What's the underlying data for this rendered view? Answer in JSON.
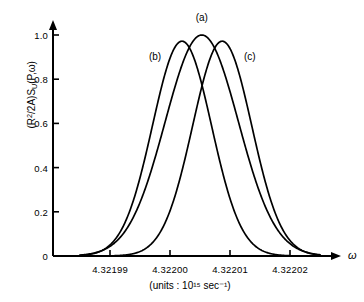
{
  "chart_data": {
    "type": "line",
    "title": "",
    "subtitle": "",
    "xlabel": "ω",
    "xunits": "(units : 10¹⁵ sec⁻¹)",
    "ylabel": "(R²/2A)Sᵤ(P,ω)",
    "xlim": [
      4.321985,
      4.322025
    ],
    "ylim": [
      0,
      1.06
    ],
    "grid": false,
    "legend_position": "inline-annotations",
    "x_tick_labels": [
      "4.32199",
      "4.32200",
      "4.32201",
      "4.32202"
    ],
    "x_tick_values": [
      4.32199,
      4.322,
      4.32201,
      4.32202
    ],
    "y_tick_labels": [
      "0",
      "0.2",
      "0.4",
      "0.6",
      "0.8",
      "1.0"
    ],
    "y_tick_values": [
      0,
      0.2,
      0.4,
      0.6,
      0.8,
      1.0
    ],
    "axis_style": "arrow-tipped",
    "line_color": "#000000",
    "background_color": "#ffffff",
    "series": [
      {
        "name": "(a)",
        "label": "(a)",
        "peak_x": 4.3220053,
        "peak_y": 1.0,
        "half_width": 7.2e-06,
        "annotation_x": 4.3220053,
        "annotation_y": 1.08
      },
      {
        "name": "(b)",
        "label": "(b)",
        "peak_x": 4.322002,
        "peak_y": 0.972,
        "half_width": 5.8e-06,
        "annotation_x": 4.3219975,
        "annotation_y": 0.905
      },
      {
        "name": "(c)",
        "label": "(c)",
        "peak_x": 4.3220087,
        "peak_y": 0.972,
        "half_width": 5.8e-06,
        "annotation_x": 4.3220133,
        "annotation_y": 0.905
      }
    ]
  }
}
